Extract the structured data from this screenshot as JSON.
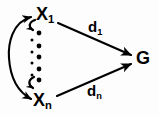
{
  "figure": {
    "background_color": "#fdfdfd",
    "stroke_color": "#000000"
  },
  "nodes": [
    {
      "id": "x1",
      "base": "X",
      "subscript": "1",
      "role": "input-node-top"
    },
    {
      "id": "xn",
      "base": "X",
      "subscript": "n",
      "role": "input-node-bottom"
    },
    {
      "id": "g",
      "base": "G",
      "subscript": "",
      "role": "goal-node"
    }
  ],
  "edges": [
    {
      "id": "d1",
      "from": "x1",
      "to": "g",
      "base": "d",
      "subscript": "1",
      "style": "straight-arrow"
    },
    {
      "id": "dn",
      "from": "xn",
      "to": "g",
      "base": "d",
      "subscript": "n",
      "style": "straight-arrow"
    },
    {
      "id": "x1-xn-link",
      "from": "x1",
      "to": "xn",
      "base": "",
      "subscript": "",
      "style": "curved-double-arrow"
    }
  ],
  "ellipsis": {
    "name": "vertical-ellipsis",
    "dot_count": 5,
    "orientation": "vertical"
  }
}
